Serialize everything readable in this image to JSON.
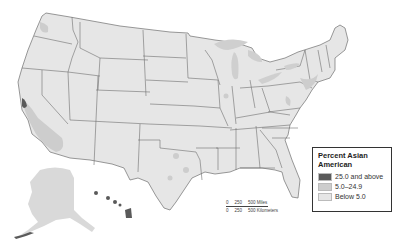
{
  "map": {
    "subject": "United States by state",
    "title": "Percent Asian American"
  },
  "legend": {
    "title": "Percent Asian American",
    "items": [
      {
        "label": "25.0 and above",
        "color": "#5a5a5a"
      },
      {
        "label": "5.0–24.9",
        "color": "#cdcdcd"
      },
      {
        "label": "Below 5.0",
        "color": "#e6e6e6"
      }
    ]
  },
  "scale_bar": {
    "miles": [
      "0",
      "250",
      "500 Miles"
    ],
    "kilometers": [
      "0",
      "250",
      "500 Kilometers"
    ]
  },
  "colors": {
    "background": "#ffffff",
    "land_low": "#e6e6e6",
    "land_mid": "#cdcdcd",
    "land_high": "#5a5a5a",
    "border": "#6e6e6e",
    "water": "#cfcfcf"
  }
}
